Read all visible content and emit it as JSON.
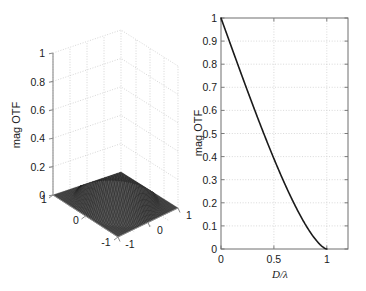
{
  "figure": {
    "background_color": "#ffffff",
    "axis_color": "#262626",
    "grid_color": "#b8b8b8",
    "curve_color": "#1a1a1a",
    "surface_color": "#303030"
  },
  "panels": [
    {
      "id": "surface-panel",
      "kind": "surface3d",
      "zlabel": "mag OTF",
      "z_ticks": [
        "0",
        "0.2",
        "0.4",
        "0.6",
        "0.8",
        "1"
      ],
      "x_ticks": [
        "-1",
        "0",
        "1"
      ],
      "y_ticks": [
        "-1",
        "0",
        "1"
      ]
    },
    {
      "id": "line-panel",
      "kind": "line",
      "ylabel": "mag OTF",
      "xlabel": "D/λ",
      "xlabel_num": "D",
      "xlabel_slash": "/",
      "xlabel_den": "λ",
      "y_ticks": [
        "0",
        "0.1",
        "0.2",
        "0.3",
        "0.4",
        "0.5",
        "0.6",
        "0.7",
        "0.8",
        "0.9",
        "1"
      ],
      "x_ticks": [
        "0",
        "0.5",
        "1"
      ]
    }
  ],
  "chart_data": [
    {
      "type": "surface",
      "title": "",
      "xlabel": "",
      "ylabel": "",
      "zlabel": "mag OTF",
      "xlim": [
        -1,
        1
      ],
      "ylim": [
        -1,
        1
      ],
      "zlim": [
        0,
        1
      ],
      "xticks": [
        -1,
        0,
        1
      ],
      "yticks": [
        -1,
        0,
        1
      ],
      "zticks": [
        0,
        0.2,
        0.4,
        0.6,
        0.8,
        1
      ],
      "grid": true,
      "description": "2-D diffraction-limited magnitude OTF rendered as a dark wireframe mesh surface peaking at 1 over the origin and falling to 0 at the cutoff radius.",
      "peak_value": 1.0,
      "peak_location": [
        0,
        0
      ],
      "colormap": "gray"
    },
    {
      "type": "line",
      "title": "",
      "xlabel": "D/λ",
      "ylabel": "mag OTF",
      "xlim": [
        0,
        1.2
      ],
      "ylim": [
        0,
        1
      ],
      "xticks": [
        0,
        0.5,
        1
      ],
      "yticks": [
        0,
        0.1,
        0.2,
        0.3,
        0.4,
        0.5,
        0.6,
        0.7,
        0.8,
        0.9,
        1
      ],
      "grid": true,
      "legend": null,
      "series": [
        {
          "name": "diffraction-limited MTF",
          "x": [
            0,
            0.05,
            0.1,
            0.15,
            0.2,
            0.25,
            0.3,
            0.35,
            0.4,
            0.45,
            0.5,
            0.55,
            0.6,
            0.65,
            0.7,
            0.75,
            0.8,
            0.85,
            0.9,
            0.95,
            1.0
          ],
          "y": [
            1.0,
            0.936,
            0.873,
            0.81,
            0.747,
            0.685,
            0.624,
            0.564,
            0.505,
            0.447,
            0.391,
            0.336,
            0.284,
            0.234,
            0.187,
            0.144,
            0.104,
            0.069,
            0.039,
            0.016,
            0.0
          ]
        }
      ]
    }
  ]
}
